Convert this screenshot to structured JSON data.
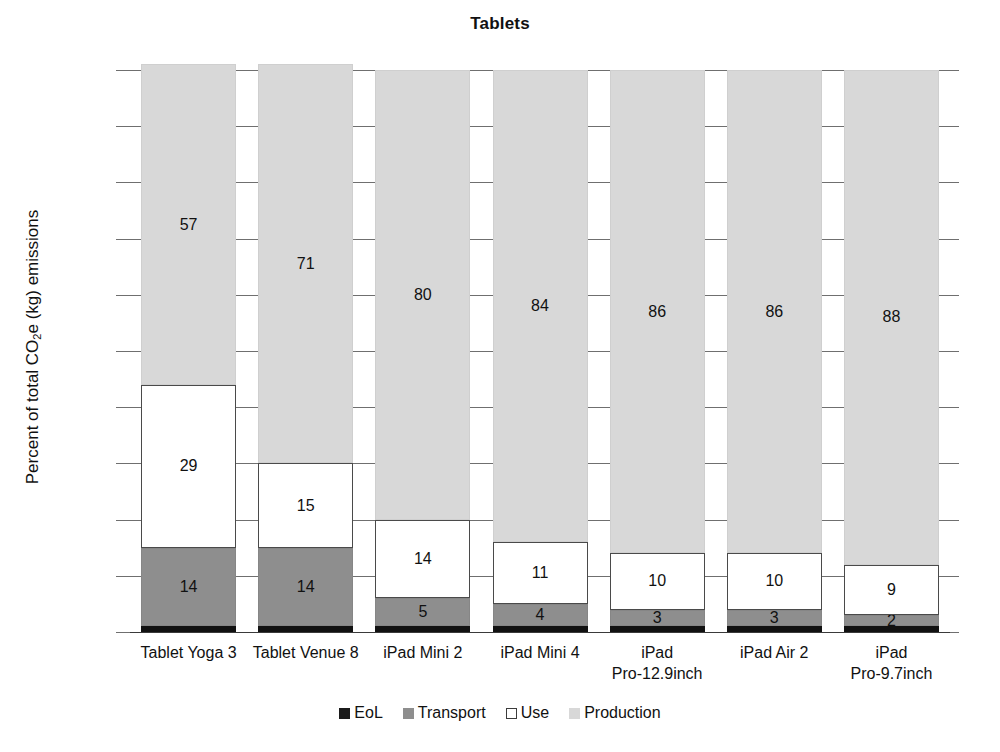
{
  "chart_data": {
    "type": "bar",
    "subtype": "stacked-percent",
    "title": "Tablets",
    "xlabel": "",
    "ylabel": "Percent of total CO2e (kg) emissions",
    "ylabel_parts": {
      "prefix": "Percent of total CO",
      "sub": "2",
      "suffix": "e (kg) emissions"
    },
    "ylim": [
      0,
      100
    ],
    "grid": true,
    "legend_position": "bottom",
    "ytick_labels": [
      "100%",
      "90%",
      "80%",
      "70%",
      "60%",
      "50%",
      "40%",
      "30%",
      "20%",
      "10%",
      "0%"
    ],
    "ytick_values": [
      100,
      90,
      80,
      70,
      60,
      50,
      40,
      30,
      20,
      10,
      0
    ],
    "categories": [
      "Tablet Yoga 3",
      "Tablet Venue 8",
      "iPad Mini 2",
      "iPad Mini 4",
      "iPad\nPro-12.9inch",
      "iPad Air 2",
      "iPad\nPro-9.7inch"
    ],
    "category_lines": [
      [
        "Tablet Yoga 3"
      ],
      [
        "Tablet Venue 8"
      ],
      [
        "iPad Mini 2"
      ],
      [
        "iPad Mini 4"
      ],
      [
        "iPad",
        "Pro-12.9inch"
      ],
      [
        "iPad Air 2"
      ],
      [
        "iPad",
        "Pro-9.7inch"
      ]
    ],
    "series": [
      {
        "name": "EoL",
        "color": "#1b1b1b",
        "values": [
          1,
          1,
          1,
          1,
          1,
          1,
          1
        ],
        "show_labels": false
      },
      {
        "name": "Transport",
        "color": "#8e8e8e",
        "values": [
          14,
          14,
          5,
          4,
          3,
          3,
          2
        ],
        "show_labels": true
      },
      {
        "name": "Use",
        "color": "#ffffff",
        "values": [
          29,
          15,
          14,
          11,
          10,
          10,
          9
        ],
        "show_labels": true
      },
      {
        "name": "Production",
        "color": "#d8d8d8",
        "values": [
          57,
          71,
          80,
          84,
          86,
          86,
          88
        ],
        "show_labels": true
      }
    ],
    "legend_entries": [
      "EoL",
      "Transport",
      "Use",
      "Production"
    ]
  },
  "colors": {
    "eol": "#1b1b1b",
    "transport": "#8e8e8e",
    "use": "#ffffff",
    "production": "#d8d8d8",
    "axis": "#6f6f6f",
    "text": "#111111",
    "background": "#ffffff"
  }
}
